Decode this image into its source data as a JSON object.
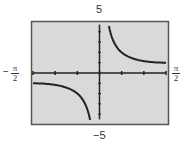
{
  "chart_data": {
    "type": "line",
    "title": "",
    "function": "y = csc x",
    "xlabel": "",
    "ylabel": "",
    "xlim": [
      -1.5708,
      1.5708
    ],
    "ylim": [
      -5,
      5
    ],
    "x_tick_labels": {
      "left": "π",
      "left_den": "2",
      "left_sign": "−",
      "right": "π",
      "right_den": "2"
    },
    "y_tick_labels": {
      "top": "5",
      "bottom": "−5"
    },
    "x_ticks_count": 6,
    "y_ticks_per_unit": 1,
    "grid": false,
    "background": "#d9d9d9",
    "line_color": "#222222",
    "series": [
      {
        "name": "right-branch",
        "x": [
          0.2,
          0.3,
          0.5,
          0.75,
          1.0,
          1.25,
          1.5708
        ],
        "y": [
          5.03,
          3.38,
          2.09,
          1.47,
          1.19,
          1.05,
          1.0
        ]
      },
      {
        "name": "left-branch",
        "x": [
          -1.5708,
          -1.25,
          -1.0,
          -0.75,
          -0.5,
          -0.3,
          -0.2
        ],
        "y": [
          -1.0,
          -1.05,
          -1.19,
          -1.47,
          -2.09,
          -3.38,
          -5.03
        ]
      }
    ]
  }
}
